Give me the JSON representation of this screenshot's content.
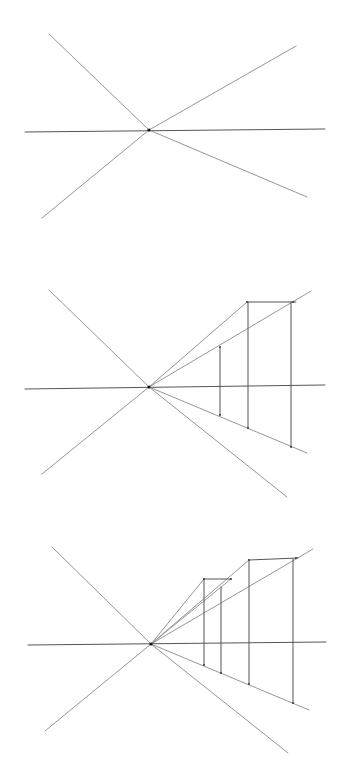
{
  "colors": {
    "background": "#ffffff",
    "line": "#8a8a8a",
    "dark": "#555555",
    "vanishing_point": "#111111"
  },
  "panels": [
    {
      "name": "step-1-vanishing-lines",
      "vanishing_point": [
        149,
        130
      ],
      "lines": [
        {
          "name": "upper-left-ray",
          "p1": [
            49,
            34
          ],
          "p2": [
            149,
            130
          ]
        },
        {
          "name": "upper-right-ray",
          "p1": [
            149,
            130
          ],
          "p2": [
            296,
            46
          ]
        },
        {
          "name": "horizon-line",
          "p1": [
            25,
            132
          ],
          "p2": [
            325,
            129
          ],
          "dark": true
        },
        {
          "name": "lower-left-ray",
          "p1": [
            42,
            218
          ],
          "p2": [
            149,
            130
          ]
        },
        {
          "name": "lower-right-ray",
          "p1": [
            149,
            130
          ],
          "p2": [
            307,
            197
          ]
        }
      ],
      "points": []
    },
    {
      "name": "step-2-first-building",
      "vanishing_point": [
        149,
        387
      ],
      "lines": [
        {
          "name": "upper-left-ray",
          "p1": [
            49,
            290
          ],
          "p2": [
            149,
            387
          ]
        },
        {
          "name": "ray-to-box-top-left",
          "p1": [
            149,
            387
          ],
          "p2": [
            247,
            302
          ]
        },
        {
          "name": "upper-right-ray",
          "p1": [
            149,
            387
          ],
          "p2": [
            311,
            291
          ]
        },
        {
          "name": "box-top-edge",
          "p1": [
            247,
            302
          ],
          "p2": [
            296,
            302
          ],
          "dark": true
        },
        {
          "name": "horizon-line",
          "p1": [
            25,
            389
          ],
          "p2": [
            325,
            385
          ],
          "dark": true
        },
        {
          "name": "lower-ground-ray",
          "p1": [
            149,
            387
          ],
          "p2": [
            307,
            453
          ]
        },
        {
          "name": "lower-left-ray",
          "p1": [
            42,
            474
          ],
          "p2": [
            149,
            387
          ]
        },
        {
          "name": "lower-right-ray",
          "p1": [
            149,
            387
          ],
          "p2": [
            287,
            497
          ]
        },
        {
          "name": "vertical-1",
          "p1": [
            220,
            347
          ],
          "p2": [
            220,
            415
          ],
          "dark": true
        },
        {
          "name": "vertical-2",
          "p1": [
            248,
            302
          ],
          "p2": [
            248,
            428
          ],
          "dark": true
        },
        {
          "name": "vertical-3",
          "p1": [
            291,
            302
          ],
          "p2": [
            291,
            447
          ],
          "dark": true
        }
      ],
      "points": [
        [
          247,
          302
        ],
        [
          293,
          302
        ],
        [
          220,
          347
        ],
        [
          220,
          415
        ],
        [
          248,
          428
        ],
        [
          291,
          447
        ]
      ]
    },
    {
      "name": "step-3-second-building",
      "vanishing_point": [
        151,
        644
      ],
      "lines": [
        {
          "name": "upper-left-ray",
          "p1": [
            52,
            547
          ],
          "p2": [
            151,
            644
          ]
        },
        {
          "name": "ray-to-small-box-top-left",
          "p1": [
            151,
            644
          ],
          "p2": [
            204,
            579
          ]
        },
        {
          "name": "ray-to-small-box-top-right",
          "p1": [
            151,
            644
          ],
          "p2": [
            231,
            579
          ]
        },
        {
          "name": "ray-to-large-box-top-left",
          "p1": [
            151,
            644
          ],
          "p2": [
            249,
            560
          ]
        },
        {
          "name": "upper-right-ray",
          "p1": [
            151,
            644
          ],
          "p2": [
            313,
            549
          ]
        },
        {
          "name": "small-box-top-edge",
          "p1": [
            204,
            579
          ],
          "p2": [
            231,
            579
          ],
          "dark": true
        },
        {
          "name": "large-box-top-edge",
          "p1": [
            249,
            560
          ],
          "p2": [
            298,
            558
          ],
          "dark": true
        },
        {
          "name": "horizon-line",
          "p1": [
            28,
            645
          ],
          "p2": [
            326,
            642
          ],
          "dark": true
        },
        {
          "name": "lower-ground-ray",
          "p1": [
            151,
            644
          ],
          "p2": [
            309,
            710
          ]
        },
        {
          "name": "lower-left-ray",
          "p1": [
            45,
            731
          ],
          "p2": [
            151,
            644
          ]
        },
        {
          "name": "lower-right-ray",
          "p1": [
            151,
            644
          ],
          "p2": [
            288,
            753
          ]
        },
        {
          "name": "vertical-1",
          "p1": [
            204,
            579
          ],
          "p2": [
            204,
            665
          ],
          "dark": true
        },
        {
          "name": "vertical-2",
          "p1": [
            221,
            587
          ],
          "p2": [
            221,
            673
          ],
          "dark": true
        },
        {
          "name": "vertical-3",
          "p1": [
            249,
            560
          ],
          "p2": [
            249,
            684
          ],
          "dark": true
        },
        {
          "name": "vertical-4",
          "p1": [
            293,
            559
          ],
          "p2": [
            293,
            703
          ],
          "dark": true
        }
      ],
      "points": [
        [
          204,
          579
        ],
        [
          231,
          579
        ],
        [
          249,
          560
        ],
        [
          296,
          558
        ],
        [
          204,
          665
        ],
        [
          221,
          673
        ],
        [
          249,
          684
        ],
        [
          293,
          703
        ]
      ]
    }
  ]
}
